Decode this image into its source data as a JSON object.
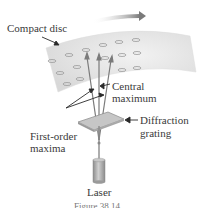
{
  "diagram": {
    "labels": {
      "compact_disc": "Compact disc",
      "central_maximum_line1": "Central",
      "central_maximum_line2": "maximum",
      "first_order_line1": "First-order",
      "first_order_line2": "maxima",
      "diffraction_line1": "Diffraction",
      "diffraction_line2": "grating",
      "laser": "Laser"
    },
    "caption": "Figure 38.14",
    "colors": {
      "disc": "#e6e6e6",
      "pits": "#9a9a9a",
      "beams": "#7a7a7a",
      "grating": "#bdbdbd",
      "laser_body": "#b0b0b0",
      "text": "#3a3a3a",
      "rotation_arrow": "#808080"
    },
    "icons": {
      "rotation_arrow": "arrow-right-icon",
      "pointer_arrows": "arrow-icon"
    }
  }
}
